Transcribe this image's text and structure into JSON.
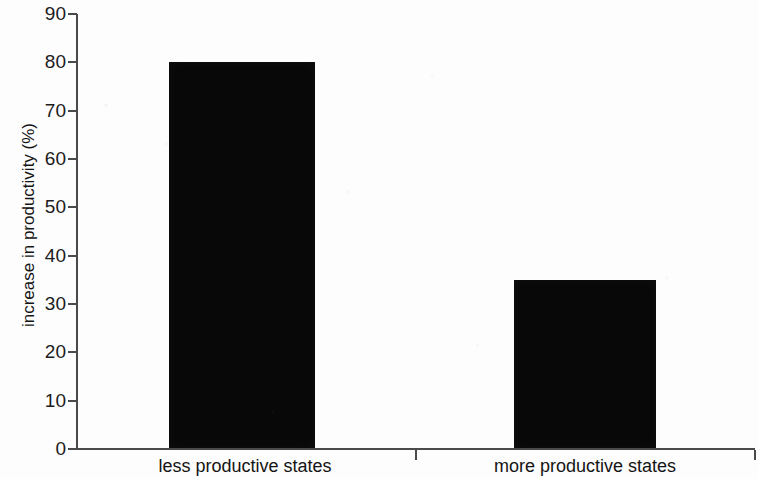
{
  "chart_data": {
    "type": "bar",
    "title": "",
    "xlabel": "",
    "ylabel": "increase in productivity (%)",
    "categories": [
      "less productive states",
      "more productive states"
    ],
    "values": [
      80,
      35
    ],
    "ylim": [
      0,
      90
    ],
    "ytick_step": 10,
    "yticks": [
      "90",
      "80",
      "70",
      "60",
      "50",
      "40",
      "30",
      "20",
      "10",
      "0"
    ],
    "ytick_values": [
      90,
      80,
      70,
      60,
      50,
      40,
      30,
      20,
      10,
      0
    ],
    "grid": false,
    "legend": null,
    "bar_color": "#080808",
    "axis_color": "#4a4a4a",
    "background_color": "#fdfdfd"
  }
}
